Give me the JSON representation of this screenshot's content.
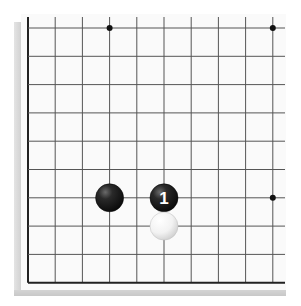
{
  "board": {
    "size_visible": {
      "cols": 10,
      "rows": 10
    },
    "origin": {
      "x": 28,
      "y": 28
    },
    "spacing": {
      "x": 27.2,
      "y": 28.3
    },
    "edges": [
      "left",
      "bottom"
    ],
    "colors": {
      "background": "#fafafa",
      "line": "#555555",
      "edge": "#222222",
      "black_stone": "#1a1a1a",
      "white_stone": "#f4f4f4"
    },
    "star_points": [
      {
        "col": 3,
        "row": 0
      },
      {
        "col": 9,
        "row": 0
      },
      {
        "col": 9,
        "row": 6
      }
    ],
    "stones": [
      {
        "color": "black",
        "col": 3,
        "row": 6,
        "label": ""
      },
      {
        "color": "black",
        "col": 5,
        "row": 6,
        "label": "1"
      },
      {
        "color": "white",
        "col": 5,
        "row": 7,
        "label": ""
      }
    ]
  }
}
